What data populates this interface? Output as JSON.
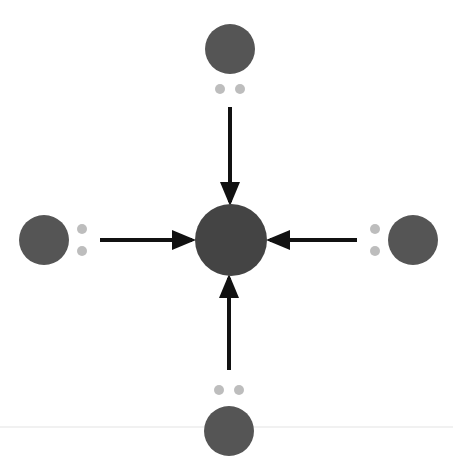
{
  "diagram": {
    "colors": {
      "background": "#ffffff",
      "atom": "#555555",
      "central_atom": "#444444",
      "lone_pair": "#bdbdbd",
      "arrow": "#111111",
      "baseline": "#ececec"
    },
    "central_atom": {
      "cx": 231,
      "cy": 240,
      "r": 36
    },
    "outer_atoms": [
      {
        "name": "top",
        "cx": 230,
        "cy": 49,
        "r": 25,
        "pair": [
          [
            220,
            89
          ],
          [
            240,
            89
          ]
        ]
      },
      {
        "name": "left",
        "cx": 44,
        "cy": 240,
        "r": 25,
        "pair": [
          [
            82,
            229
          ],
          [
            82,
            251
          ]
        ]
      },
      {
        "name": "right",
        "cx": 413,
        "cy": 240,
        "r": 25,
        "pair": [
          [
            375,
            229
          ],
          [
            375,
            251
          ]
        ]
      },
      {
        "name": "bottom",
        "cx": 229,
        "cy": 431,
        "r": 25,
        "pair": [
          [
            219,
            390
          ],
          [
            239,
            390
          ]
        ]
      }
    ],
    "arrows": [
      {
        "name": "top-to-center",
        "x1": 230,
        "y1": 107,
        "x2": 230,
        "y2": 202
      },
      {
        "name": "left-to-center",
        "x1": 100,
        "y1": 240,
        "x2": 192,
        "y2": 240
      },
      {
        "name": "right-to-center",
        "x1": 357,
        "y1": 240,
        "x2": 270,
        "y2": 240
      },
      {
        "name": "bottom-to-center",
        "x1": 229,
        "y1": 370,
        "x2": 229,
        "y2": 278
      }
    ]
  }
}
